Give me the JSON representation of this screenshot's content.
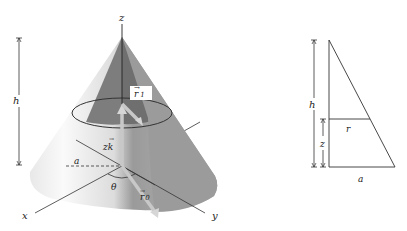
{
  "cone_figure": {
    "axis_labels": {
      "z": "z",
      "x": "x",
      "y": "y"
    },
    "dimension_label_h": "h",
    "vector_r1": "r",
    "vector_r1_subscript": "1",
    "vector_zk": "zk",
    "vector_r0": "r",
    "vector_r0_subscript": "0",
    "radius_label_a": "a",
    "angle_label_theta": "θ",
    "colors": {
      "cone_light": "#f2f2f2",
      "cone_mid": "#b4b4b4",
      "cone_dark": "#8a8a8a",
      "vector": "#c8c8c8",
      "lines": "#333333"
    }
  },
  "triangle_figure": {
    "dimension_label_h": "h",
    "dimension_label_z": "z",
    "radius_label_r": "r",
    "base_label_a": "a"
  }
}
